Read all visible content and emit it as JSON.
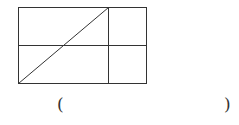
{
  "figure": {
    "line_color": "#333333"
  },
  "answer": {
    "open_paren": "(",
    "close_paren": ")",
    "blank": ""
  }
}
